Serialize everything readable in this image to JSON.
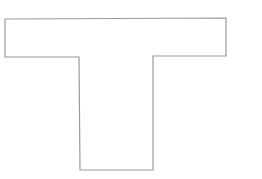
{
  "diagram": {
    "shape": "T-shape outline",
    "stroke_color": "#9a9a9a",
    "fill_color": "#ffffff",
    "background": "#ffffff",
    "points": "5,19 226,18 226,56 153,56 153,170 80,170 79,57 5,57"
  }
}
